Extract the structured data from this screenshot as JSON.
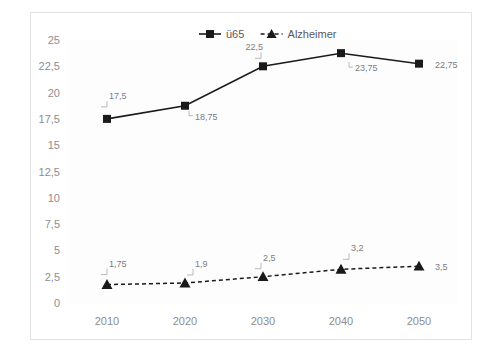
{
  "chart_data": {
    "type": "line",
    "title": "",
    "xlabel": "",
    "ylabel": "",
    "categories": [
      "2010",
      "2020",
      "2030",
      "2040",
      "2050"
    ],
    "ylim": [
      0,
      25
    ],
    "ytick_labels": [
      "0",
      "2,5",
      "5",
      "7,5",
      "10",
      "12,5",
      "15",
      "17,5",
      "20",
      "22,5",
      "25"
    ],
    "ytick_values": [
      0,
      2.5,
      5,
      7.5,
      10,
      12.5,
      15,
      17.5,
      20,
      22.5,
      25
    ],
    "grid": false,
    "legend_position": "top-center",
    "series": [
      {
        "name": "ü65",
        "marker": "square",
        "line_style": "solid",
        "color": "#1a1a1a",
        "values": [
          17.5,
          18.75,
          22.5,
          23.75,
          22.75
        ],
        "value_labels": [
          "17,5",
          "18,75",
          "22,5",
          "23,75",
          "22,75"
        ]
      },
      {
        "name": "Alzheimer",
        "marker": "triangle",
        "line_style": "dashed",
        "color": "#1a1a1a",
        "values": [
          1.75,
          1.9,
          2.5,
          3.2,
          3.5
        ],
        "value_labels": [
          "1,75",
          "1,9",
          "2,5",
          "3,2",
          "3,5"
        ]
      }
    ]
  },
  "legend": {
    "items": [
      {
        "label": "ü65"
      },
      {
        "label": "Alzheimer"
      }
    ]
  }
}
